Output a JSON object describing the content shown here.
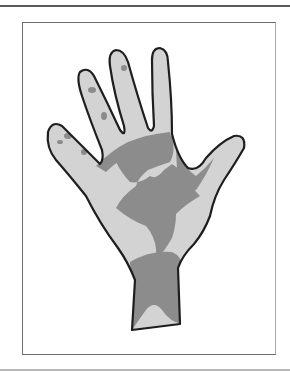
{
  "figure": {
    "colors": {
      "outline": "#1e1e1e",
      "skin_light": "#d3d3d3",
      "patch_dark": "#8c8c8c",
      "frame_border": "#6e6e6e",
      "background": "#ffffff"
    }
  }
}
